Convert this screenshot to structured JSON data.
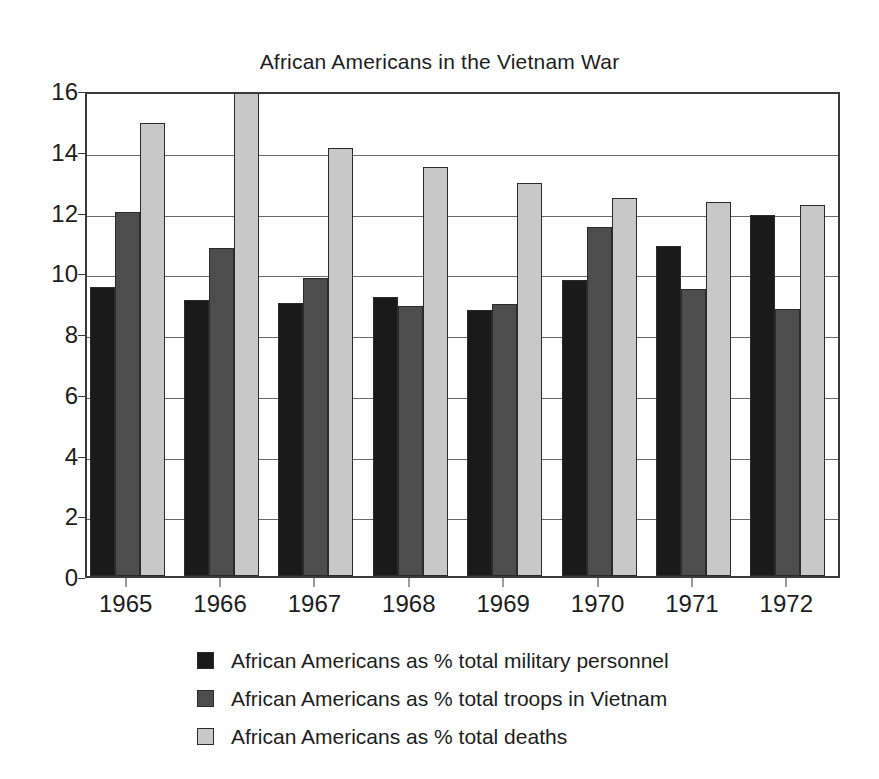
{
  "chart_data": {
    "type": "bar",
    "title": "African Americans in the Vietnam War",
    "xlabel": "",
    "ylabel": "",
    "ylim": [
      0,
      16
    ],
    "ytick_step": 2,
    "yticks": [
      "16",
      "14",
      "12",
      "10",
      "8",
      "6",
      "4",
      "2",
      "0"
    ],
    "grid": true,
    "legend_position": "bottom",
    "categories": [
      "1965",
      "1966",
      "1967",
      "1968",
      "1969",
      "1970",
      "1971",
      "1972"
    ],
    "series": [
      {
        "name": "African Americans as % total military personnel",
        "color": "#1a1a1a",
        "values": [
          9.5,
          9.1,
          9.0,
          9.2,
          8.75,
          9.75,
          10.85,
          11.9
        ]
      },
      {
        "name": "African Americans as % total troops in Vietnam",
        "color": "#4d4d4d",
        "values": [
          12.0,
          10.8,
          9.8,
          8.9,
          8.95,
          11.5,
          9.45,
          8.8
        ]
      },
      {
        "name": "African Americans as % total deaths",
        "color": "#c8c8c8",
        "values": [
          14.9,
          16.0,
          14.1,
          13.45,
          12.95,
          12.45,
          12.3,
          12.2
        ],
        "notes": "1966 bar is clipped at the top of the 0-16 axis"
      }
    ]
  },
  "legend": {
    "items": [
      {
        "label": "African Americans as % total military personnel",
        "color": "#1a1a1a",
        "swatch_name": "legend-swatch-military-personnel"
      },
      {
        "label": "African Americans as % total troops in Vietnam",
        "color": "#4d4d4d",
        "swatch_name": "legend-swatch-troops-in-vietnam"
      },
      {
        "label": "African Americans as % total deaths",
        "color": "#c8c8c8",
        "swatch_name": "legend-swatch-total-deaths"
      }
    ]
  },
  "colors": {
    "axis": "#3a3a3a",
    "grid": "#6a6a6a",
    "text": "#1d1d1d",
    "background": "#ffffff",
    "bar_border": "#2b2b2b"
  }
}
